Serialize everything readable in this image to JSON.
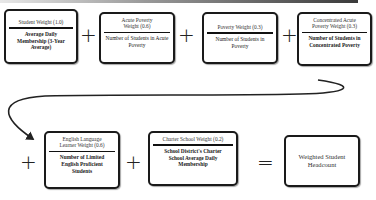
{
  "diagram": {
    "title_bar": true,
    "row1": [
      {
        "id": "student-weight",
        "weight": "Student Weight (1.0)",
        "description": "Average Daily Membership (3-Year Average)"
      },
      {
        "id": "acute-poverty",
        "weight": "Acute Poverty Weight (0.6)",
        "description": "Number of Students in Acute Poverty"
      },
      {
        "id": "poverty",
        "weight": "Poverty Weight (0.3)",
        "description": "Number of Students in Poverty"
      },
      {
        "id": "concentrated-acute-poverty",
        "weight": "Concentrated Acute Poverty Weight (0.3)",
        "description": "Number of Students in Concentrated Poverty"
      }
    ],
    "row2": [
      {
        "id": "english-learner",
        "weight": "English Language Learner Weight (0.6)",
        "description": "Number of Limited English Proficient Students"
      },
      {
        "id": "charter-school",
        "weight": "Charter School Weight (0.2)",
        "description": "School District's Charter School Average Daily Membership"
      }
    ],
    "operators": {
      "plus": "+",
      "equals": "="
    },
    "result": {
      "label": "Weighted Student Headcount"
    },
    "colors": {
      "border": "#1a1a1a",
      "background": "#ffffff",
      "text": "#222222"
    }
  }
}
